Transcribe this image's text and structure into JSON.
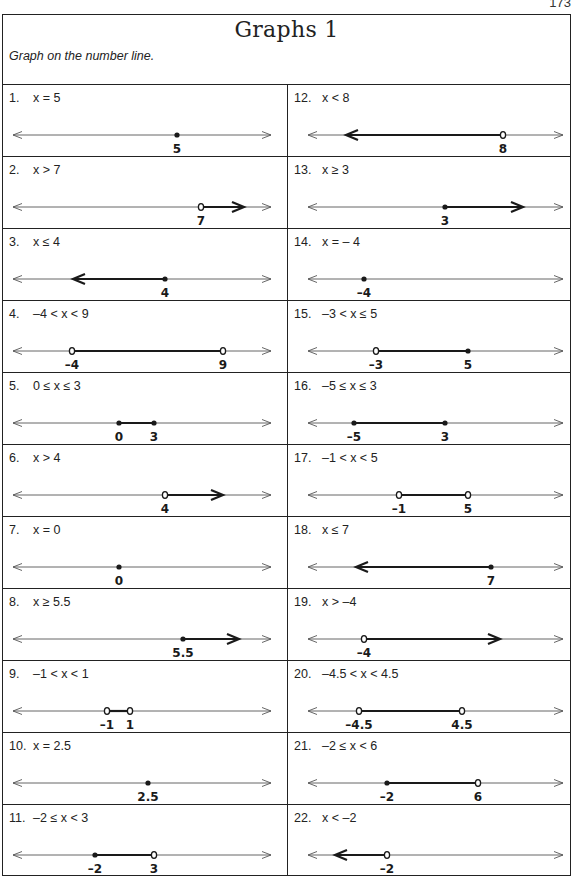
{
  "page_number": "173",
  "header": {
    "title": "Graphs 1",
    "instruction": "Graph on the number line."
  },
  "colors": {
    "line": "#555555",
    "ink": "#1a1a1a",
    "border": "#222222"
  },
  "problems": [
    {
      "num": "1.",
      "expr": "x = 5",
      "marks": [
        {
          "label": "5",
          "x": 174,
          "type": "closed"
        }
      ],
      "seg": null
    },
    {
      "num": "2.",
      "expr": "x > 7",
      "marks": [
        {
          "label": "7",
          "x": 198,
          "type": "open"
        }
      ],
      "seg": {
        "from": 198,
        "to": 241,
        "arrow": "right"
      }
    },
    {
      "num": "3.",
      "expr": "x ≤ 4",
      "marks": [
        {
          "label": "4",
          "x": 162,
          "type": "closed"
        }
      ],
      "seg": {
        "from": 162,
        "to": 70,
        "arrow": "left"
      }
    },
    {
      "num": "4.",
      "expr": "–4 < x < 9",
      "marks": [
        {
          "label": "–4",
          "x": 69,
          "type": "open"
        },
        {
          "label": "9",
          "x": 220,
          "type": "open"
        }
      ],
      "seg": {
        "from": 69,
        "to": 220,
        "arrow": null
      }
    },
    {
      "num": "5.",
      "expr": "0 ≤ x ≤ 3",
      "marks": [
        {
          "label": "0",
          "x": 116,
          "type": "closed"
        },
        {
          "label": "3",
          "x": 151,
          "type": "closed"
        }
      ],
      "seg": {
        "from": 116,
        "to": 151,
        "arrow": null
      }
    },
    {
      "num": "6.",
      "expr": "x > 4",
      "marks": [
        {
          "label": "4",
          "x": 162,
          "type": "open"
        }
      ],
      "seg": {
        "from": 162,
        "to": 220,
        "arrow": "right"
      }
    },
    {
      "num": "7.",
      "expr": "x = 0",
      "marks": [
        {
          "label": "0",
          "x": 116,
          "type": "closed"
        }
      ],
      "seg": null
    },
    {
      "num": "8.",
      "expr": "x ≥ 5.5",
      "marks": [
        {
          "label": "5.5",
          "x": 180,
          "type": "closed"
        }
      ],
      "seg": {
        "from": 180,
        "to": 236,
        "arrow": "right"
      }
    },
    {
      "num": "9.",
      "expr": "–1 < x < 1",
      "marks": [
        {
          "label": "–1",
          "x": 104,
          "type": "open"
        },
        {
          "label": "1",
          "x": 127,
          "type": "open"
        }
      ],
      "seg": {
        "from": 104,
        "to": 127,
        "arrow": null
      }
    },
    {
      "num": "10.",
      "expr": "x = 2.5",
      "marks": [
        {
          "label": "2.5",
          "x": 145,
          "type": "closed"
        }
      ],
      "seg": null
    },
    {
      "num": "11.",
      "expr": "–2 ≤ x < 3",
      "marks": [
        {
          "label": "–2",
          "x": 92,
          "type": "closed"
        },
        {
          "label": "3",
          "x": 151,
          "type": "open"
        }
      ],
      "seg": {
        "from": 92,
        "to": 151,
        "arrow": null
      }
    },
    {
      "num": "12.",
      "expr": "x < 8",
      "marks": [
        {
          "label": "8",
          "x": 215,
          "type": "open"
        }
      ],
      "seg": {
        "from": 215,
        "to": 58,
        "arrow": "left"
      }
    },
    {
      "num": "13.",
      "expr": "x ≥ 3",
      "marks": [
        {
          "label": "3",
          "x": 157,
          "type": "closed"
        }
      ],
      "seg": {
        "from": 157,
        "to": 235,
        "arrow": "right"
      }
    },
    {
      "num": "14.",
      "expr": "x = – 4",
      "marks": [
        {
          "label": "–4",
          "x": 76,
          "type": "closed"
        }
      ],
      "seg": null
    },
    {
      "num": "15.",
      "expr": "–3 < x ≤ 5",
      "marks": [
        {
          "label": "–3",
          "x": 88,
          "type": "open"
        },
        {
          "label": "5",
          "x": 180,
          "type": "closed"
        }
      ],
      "seg": {
        "from": 88,
        "to": 180,
        "arrow": null
      }
    },
    {
      "num": "16.",
      "expr": "–5 ≤ x ≤ 3",
      "marks": [
        {
          "label": "–5",
          "x": 66,
          "type": "closed"
        },
        {
          "label": "3",
          "x": 157,
          "type": "closed"
        }
      ],
      "seg": {
        "from": 66,
        "to": 157,
        "arrow": null
      }
    },
    {
      "num": "17.",
      "expr": "–1 < x < 5",
      "marks": [
        {
          "label": "–1",
          "x": 111,
          "type": "open"
        },
        {
          "label": "5",
          "x": 180,
          "type": "open"
        }
      ],
      "seg": {
        "from": 111,
        "to": 180,
        "arrow": null
      }
    },
    {
      "num": "18.",
      "expr": "x ≤ 7",
      "marks": [
        {
          "label": "7",
          "x": 203,
          "type": "closed"
        }
      ],
      "seg": {
        "from": 203,
        "to": 68,
        "arrow": "left"
      }
    },
    {
      "num": "19.",
      "expr": "x > –4",
      "marks": [
        {
          "label": "–4",
          "x": 76,
          "type": "open"
        }
      ],
      "seg": {
        "from": 76,
        "to": 212,
        "arrow": "right"
      }
    },
    {
      "num": "20.",
      "expr": "–4.5 < x < 4.5",
      "marks": [
        {
          "label": "–4.5",
          "x": 71,
          "type": "open"
        },
        {
          "label": "4.5",
          "x": 174,
          "type": "open"
        }
      ],
      "seg": {
        "from": 71,
        "to": 174,
        "arrow": null
      }
    },
    {
      "num": "21.",
      "expr": "–2 ≤ x < 6",
      "marks": [
        {
          "label": "–2",
          "x": 99,
          "type": "closed"
        },
        {
          "label": "6",
          "x": 190,
          "type": "open"
        }
      ],
      "seg": {
        "from": 99,
        "to": 190,
        "arrow": null
      }
    },
    {
      "num": "22.",
      "expr": "x < –2",
      "marks": [
        {
          "label": "–2",
          "x": 99,
          "type": "open"
        }
      ],
      "seg": {
        "from": 99,
        "to": 47,
        "arrow": "left"
      }
    }
  ],
  "layout": {
    "left_line": {
      "x1": 10,
      "x2": 268
    },
    "right_line": {
      "x1": 20,
      "x2": 275
    },
    "line_y": 50,
    "label_y": 68
  }
}
